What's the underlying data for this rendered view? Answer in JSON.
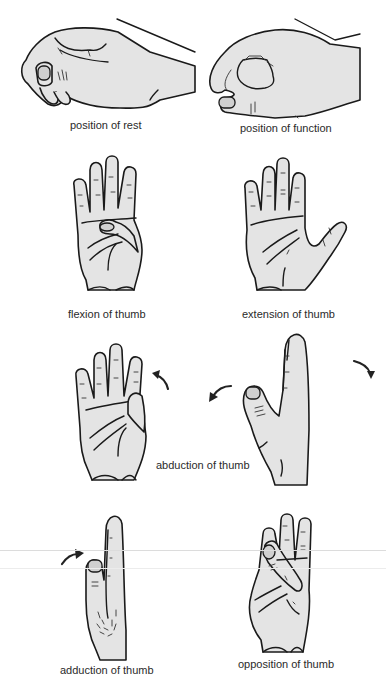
{
  "figure": {
    "panels": [
      {
        "id": "rest",
        "label": "position of rest"
      },
      {
        "id": "function",
        "label": "position of function"
      },
      {
        "id": "flexion",
        "label": "flexion of thumb"
      },
      {
        "id": "extension",
        "label": "extension of thumb"
      },
      {
        "id": "abduction",
        "label": "abduction of thumb"
      },
      {
        "id": "adduction",
        "label": "adduction of thumb"
      },
      {
        "id": "opposition",
        "label": "opposition of thumb"
      }
    ],
    "colors": {
      "skin": "#e4e4e4",
      "outline": "#1a1a1a",
      "background": "#ffffff",
      "label_text": "#2a2a2a"
    }
  }
}
